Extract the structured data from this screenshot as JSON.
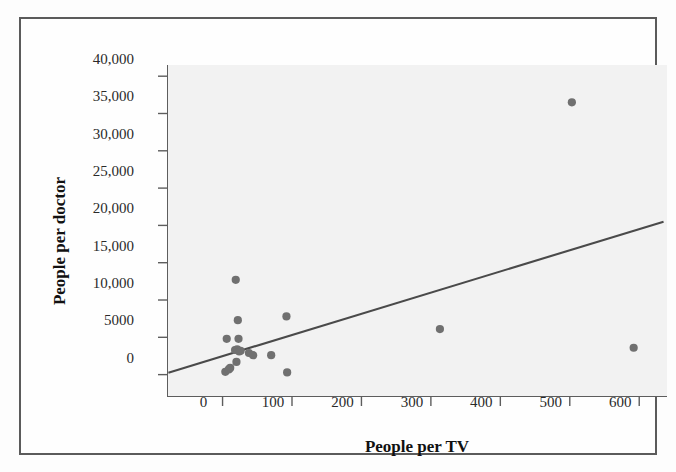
{
  "chart_data": {
    "type": "scatter",
    "title": "",
    "xlabel": "People per TV",
    "ylabel": "People per doctor",
    "xlim": [
      -80,
      640
    ],
    "ylim": [
      -3000,
      41500
    ],
    "xticks": [
      0,
      100,
      200,
      300,
      400,
      500,
      600
    ],
    "xtick_labels": [
      "0",
      "100",
      "200",
      "300",
      "400",
      "500",
      "600"
    ],
    "yticks": [
      0,
      5000,
      10000,
      15000,
      20000,
      25000,
      30000,
      35000,
      40000
    ],
    "ytick_labels": [
      "0",
      "5000",
      "10,000",
      "15,000",
      "20,000",
      "25,000",
      "30,000",
      "35,000",
      "40,000"
    ],
    "grid": false,
    "legend": false,
    "marker_color": "#707070",
    "line_color": "#4a4a4a",
    "plot_background": "#f2f2f2",
    "points": [
      {
        "x": 4,
        "y": 370
      },
      {
        "x": 6,
        "y": 4800
      },
      {
        "x": 9,
        "y": 700
      },
      {
        "x": 11,
        "y": 900
      },
      {
        "x": 18,
        "y": 3300
      },
      {
        "x": 19,
        "y": 12700
      },
      {
        "x": 20,
        "y": 1700
      },
      {
        "x": 21,
        "y": 3400
      },
      {
        "x": 22,
        "y": 7300
      },
      {
        "x": 23,
        "y": 4800
      },
      {
        "x": 24,
        "y": 3100
      },
      {
        "x": 26,
        "y": 3200
      },
      {
        "x": 38,
        "y": 2900
      },
      {
        "x": 44,
        "y": 2600
      },
      {
        "x": 70,
        "y": 2600
      },
      {
        "x": 92,
        "y": 7800
      },
      {
        "x": 93,
        "y": 300
      },
      {
        "x": 313,
        "y": 6100
      },
      {
        "x": 503,
        "y": 36500
      },
      {
        "x": 592,
        "y": 3600
      }
    ],
    "trend_line": {
      "x_start": -78,
      "y_start": 260,
      "x_end": 635,
      "y_end": 20500
    }
  }
}
